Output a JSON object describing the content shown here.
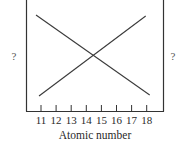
{
  "chart_data": {
    "type": "line",
    "title": "",
    "xlabel": "Atomic number",
    "ylabel_left": "?",
    "ylabel_right": "?",
    "x": [
      11,
      12,
      13,
      14,
      15,
      16,
      17,
      18
    ],
    "xticks": [
      "11",
      "12",
      "13",
      "14",
      "15",
      "16",
      "17",
      "18"
    ],
    "series": [
      {
        "name": "decreasing",
        "values": [
          1.0,
          0.857,
          0.714,
          0.571,
          0.429,
          0.286,
          0.143,
          0.0
        ]
      },
      {
        "name": "increasing",
        "values": [
          0.0,
          0.143,
          0.286,
          0.429,
          0.571,
          0.714,
          0.857,
          1.0
        ]
      }
    ],
    "xlim": [
      10.7,
      18.7
    ],
    "ylim": [
      0,
      1
    ],
    "grid": false,
    "legend": "none",
    "annotations": [
      "Lines cross between atomic numbers 14 and 15"
    ]
  },
  "axis": {
    "x_title": "Atomic number",
    "left_label": "?",
    "right_label": "?",
    "ticks": [
      "11",
      "12",
      "13",
      "14",
      "15",
      "16",
      "17",
      "18"
    ]
  }
}
